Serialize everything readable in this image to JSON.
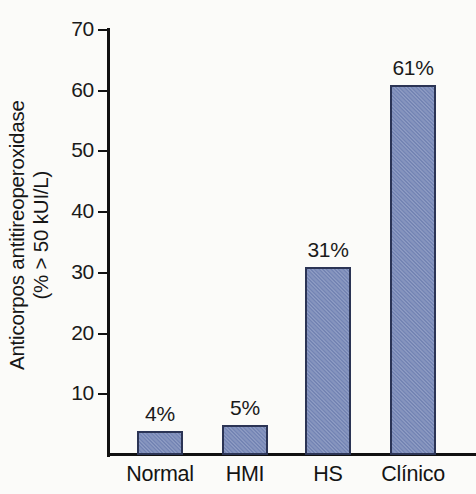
{
  "chart_data": {
    "type": "bar",
    "title": "",
    "subtitle": "",
    "xlabel": "",
    "ylabel_line1": "Anticorpos antitireoperoxidase",
    "ylabel_line2": "(% > 50 kUI/L)",
    "categories": [
      "Normal",
      "HMI",
      "HS",
      "Clínico"
    ],
    "values": [
      4,
      5,
      31,
      61
    ],
    "value_labels": [
      "4%",
      "5%",
      "31%",
      "61%"
    ],
    "ylim": [
      0,
      70
    ],
    "yticks": [
      10,
      20,
      30,
      40,
      50,
      60,
      70
    ],
    "ytick_labels": [
      "10",
      "20",
      "30",
      "40",
      "50",
      "60",
      "70"
    ],
    "grid": false,
    "legend": false,
    "bar_fill_color": "#7d8dbc",
    "bar_border_color": "#2b3455",
    "axis_color": "#111111",
    "text_color": "#1a1a1a",
    "background_color": "#fbfbf9"
  }
}
